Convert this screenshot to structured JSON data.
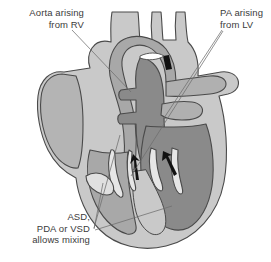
{
  "figure": {
    "background_color": "#ffffff",
    "colors": {
      "myocardium_light": "#c9c9c9",
      "chamber_mid": "#a8a8a8",
      "chamber_dark": "#8a8a8a",
      "vessel_light": "#cfcfcf",
      "outline": "#4a4a4a",
      "arrow": "#121212",
      "leader_line": "#6e6e6e",
      "text": "#3b3b3b"
    }
  },
  "annotations": {
    "aorta_from_rv": {
      "line1": "Aorta arising",
      "line2": "from RV",
      "text": "Aorta arising\nfrom RV"
    },
    "pa_from_lv": {
      "line1": "PA arising",
      "line2": "from LV",
      "text": "PA arising\nfrom LV"
    },
    "shunts": {
      "line1": "ASD,",
      "line2": "PDA or VSD",
      "line3": "allows mixing",
      "text": "ASD,\nPDA or VSD\nallows mixing"
    }
  },
  "flow_arrows": {
    "count": 2,
    "description": "mixing flow arrows in ventricles"
  }
}
